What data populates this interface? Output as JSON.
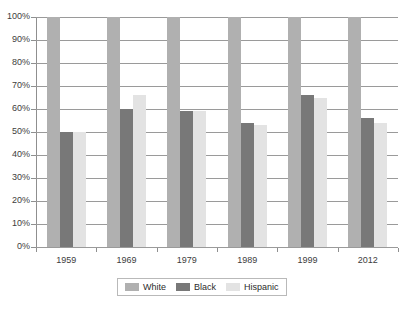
{
  "chart_data": {
    "type": "bar",
    "title": "",
    "subtitle": "",
    "xlabel": "",
    "ylabel": "",
    "categories": [
      "1959",
      "1969",
      "1979",
      "1989",
      "1999",
      "2012"
    ],
    "series": [
      {
        "name": "White",
        "color": "#b0b0b0",
        "values": [
          100,
          100,
          100,
          100,
          100,
          100
        ]
      },
      {
        "name": "Black",
        "color": "#787878",
        "values": [
          50,
          60,
          59,
          54,
          66,
          56
        ]
      },
      {
        "name": "Hispanic",
        "color": "#e3e3e3",
        "values": [
          50,
          66,
          59,
          53,
          65,
          54
        ]
      }
    ],
    "ylim": [
      0,
      100
    ],
    "ytick_labels": [
      "100%",
      "90%",
      "80%",
      "70%",
      "60%",
      "50%",
      "40%",
      "30%",
      "20%",
      "10%",
      "0%"
    ],
    "ytick_values": [
      100,
      90,
      80,
      70,
      60,
      50,
      40,
      30,
      20,
      10,
      0
    ],
    "grid": true,
    "legend_position": "bottom",
    "legend_entries": [
      "White",
      "Black",
      "Hispanic"
    ]
  }
}
